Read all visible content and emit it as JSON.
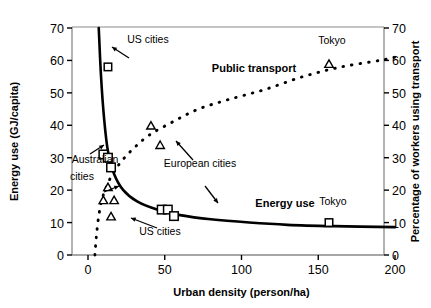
{
  "chart_data": {
    "type": "scatter",
    "title": "",
    "xlabel": "Urban density (person/ha)",
    "ylabel_left": "Energy use (GJ/capita)",
    "ylabel_right": "Percentage of workers using transport",
    "xlim": [
      0,
      200
    ],
    "ylim_left": [
      0,
      70
    ],
    "ylim_right": [
      0,
      70
    ],
    "xticks": [
      0,
      50,
      100,
      150,
      200
    ],
    "yticks_left": [
      0,
      10,
      20,
      30,
      40,
      50,
      60,
      70
    ],
    "yticks_right": [
      0,
      10,
      20,
      30,
      40,
      50,
      60,
      70
    ],
    "grid": false,
    "legend_position": "inline-annotations",
    "series": [
      {
        "name": "Energy use",
        "marker": "square",
        "line_style": "solid",
        "axis": "left",
        "curve_note": "decreasing hyperbolic curve",
        "points": [
          {
            "x": 13,
            "y": 58,
            "label": "US cities"
          },
          {
            "x": 10,
            "y": 31,
            "label": "Australian cities"
          },
          {
            "x": 13,
            "y": 30,
            "label": "Australian cities"
          },
          {
            "x": 15,
            "y": 27,
            "label": "Australian cities"
          },
          {
            "x": 48,
            "y": 14,
            "label": "European cities"
          },
          {
            "x": 52,
            "y": 14,
            "label": "European cities"
          },
          {
            "x": 56,
            "y": 12,
            "label": "European cities"
          },
          {
            "x": 157,
            "y": 10,
            "label": "Tokyo"
          }
        ],
        "curve": [
          {
            "x": 7.0,
            "y": 70
          },
          {
            "x": 8.5,
            "y": 55
          },
          {
            "x": 10.5,
            "y": 42
          },
          {
            "x": 13,
            "y": 32
          },
          {
            "x": 17,
            "y": 25
          },
          {
            "x": 23,
            "y": 20
          },
          {
            "x": 32,
            "y": 16.5
          },
          {
            "x": 45,
            "y": 14
          },
          {
            "x": 60,
            "y": 12.3
          },
          {
            "x": 80,
            "y": 11
          },
          {
            "x": 105,
            "y": 10
          },
          {
            "x": 130,
            "y": 9.3
          },
          {
            "x": 160,
            "y": 8.9
          },
          {
            "x": 200,
            "y": 8.6
          }
        ]
      },
      {
        "name": "Public transport",
        "marker": "triangle",
        "line_style": "dotted",
        "axis": "right",
        "curve_note": "increasing logarithmic curve",
        "points": [
          {
            "x": 13,
            "y": 21,
            "label": "US cities"
          },
          {
            "x": 10,
            "y": 17,
            "label": "US cities"
          },
          {
            "x": 17,
            "y": 17,
            "label": "US cities"
          },
          {
            "x": 15,
            "y": 12,
            "label": "US cities"
          },
          {
            "x": 41,
            "y": 40,
            "label": "European cities"
          },
          {
            "x": 47,
            "y": 34,
            "label": "European cities"
          },
          {
            "x": 157,
            "y": 59,
            "label": "Tokyo"
          }
        ],
        "curve": [
          {
            "x": 4.5,
            "y": 0
          },
          {
            "x": 5.5,
            "y": 6
          },
          {
            "x": 7,
            "y": 12
          },
          {
            "x": 9,
            "y": 17
          },
          {
            "x": 12,
            "y": 21
          },
          {
            "x": 16,
            "y": 25
          },
          {
            "x": 22,
            "y": 29
          },
          {
            "x": 30,
            "y": 33
          },
          {
            "x": 40,
            "y": 37
          },
          {
            "x": 55,
            "y": 41
          },
          {
            "x": 72,
            "y": 45
          },
          {
            "x": 92,
            "y": 48
          },
          {
            "x": 115,
            "y": 51
          },
          {
            "x": 140,
            "y": 55
          },
          {
            "x": 165,
            "y": 58
          },
          {
            "x": 190,
            "y": 60
          },
          {
            "x": 200,
            "y": 61
          }
        ]
      }
    ],
    "annotations": [
      {
        "id": "us-cities-top",
        "text": "US cities",
        "x": 148,
        "y": 43
      },
      {
        "id": "public-transport",
        "text": "Public transport",
        "x": 254,
        "y": 72,
        "bold": true
      },
      {
        "id": "tokyo-transport",
        "text": "Tokyo",
        "x": 332,
        "y": 44
      },
      {
        "id": "australian-cities-line1",
        "text": "Australian",
        "x": 95,
        "y": 163
      },
      {
        "id": "australian-cities-line2",
        "text": "cities",
        "x": 82,
        "y": 180
      },
      {
        "id": "european-cities",
        "text": "European cities",
        "x": 200,
        "y": 167
      },
      {
        "id": "us-cities-bottom",
        "text": "US cities",
        "x": 160,
        "y": 235
      },
      {
        "id": "energy-use",
        "text": "Energy use",
        "x": 285,
        "y": 207,
        "bold": true
      },
      {
        "id": "tokyo-energy",
        "text": "Tokyo",
        "x": 333,
        "y": 205
      }
    ]
  }
}
